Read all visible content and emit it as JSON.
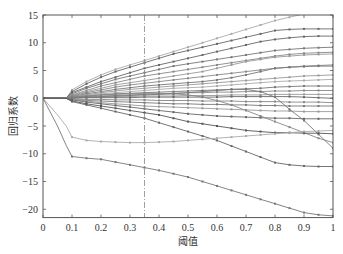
{
  "chart_data": {
    "type": "line",
    "title": "",
    "xlabel": "阈值",
    "ylabel": "回归系数",
    "xlim": [
      0,
      1
    ],
    "ylim": [
      -21.5,
      15
    ],
    "xticks": [
      0,
      0.1,
      0.2,
      0.3,
      0.4,
      0.5,
      0.6,
      0.7,
      0.8,
      0.9,
      1
    ],
    "xtick_labels": [
      "0",
      "0.1",
      "0.2",
      "0.3",
      "0.4",
      "0.5",
      "0.6",
      "0.7",
      "0.8",
      "0.9",
      "1"
    ],
    "yticks": [
      15,
      10,
      5,
      0,
      -5,
      -10,
      -15,
      -20
    ],
    "ytick_labels": [
      "15",
      "10",
      "5",
      "0",
      "−5",
      "−10",
      "−15",
      "−20"
    ],
    "grid": false,
    "legend": null,
    "vline": {
      "x": 0.35,
      "style": "dash-dot",
      "color": "#888888"
    },
    "x": [
      0,
      0.05,
      0.08,
      0.1,
      0.15,
      0.2,
      0.25,
      0.3,
      0.35,
      0.4,
      0.45,
      0.5,
      0.55,
      0.6,
      0.65,
      0.7,
      0.75,
      0.8,
      0.85,
      0.9,
      0.95,
      1
    ],
    "series": [
      {
        "name": "s1",
        "color": "#aaaaaa",
        "values": [
          0,
          0,
          0,
          1.5,
          3.0,
          4.2,
          5.2,
          6.0,
          6.8,
          7.6,
          8.4,
          9.2,
          10.0,
          10.8,
          11.6,
          12.4,
          13.2,
          14.0,
          14.6,
          15.2,
          15.6,
          16.0
        ]
      },
      {
        "name": "s2",
        "color": "#666666",
        "values": [
          0,
          0,
          0,
          1.2,
          2.6,
          3.8,
          4.8,
          5.6,
          6.4,
          7.2,
          8.0,
          8.6,
          9.2,
          9.8,
          10.4,
          11.0,
          11.6,
          12.2,
          12.4,
          12.5,
          12.5,
          12.5
        ]
      },
      {
        "name": "s3",
        "color": "#666666",
        "values": [
          0,
          0,
          0,
          1.0,
          2.0,
          3.0,
          3.8,
          4.6,
          5.4,
          6.0,
          6.6,
          7.2,
          7.8,
          8.4,
          9.0,
          9.6,
          10.2,
          10.6,
          10.9,
          11.1,
          11.2,
          11.2
        ]
      },
      {
        "name": "s4",
        "color": "#777777",
        "values": [
          0,
          0,
          0,
          0.8,
          1.8,
          2.6,
          3.4,
          4.0,
          4.6,
          5.2,
          5.8,
          6.2,
          6.6,
          7.0,
          7.4,
          7.8,
          8.2,
          8.6,
          8.8,
          9.0,
          9.1,
          9.2
        ]
      },
      {
        "name": "s5",
        "color": "#888888",
        "values": [
          0,
          0,
          0,
          0.6,
          1.4,
          2.2,
          2.8,
          3.4,
          4.0,
          4.4,
          4.8,
          5.2,
          5.6,
          6.0,
          6.4,
          6.8,
          7.2,
          7.6,
          7.9,
          8.1,
          8.2,
          8.3
        ]
      },
      {
        "name": "s6",
        "color": "#999999",
        "values": [
          0,
          0,
          0,
          0.5,
          1.2,
          1.8,
          2.4,
          2.8,
          3.2,
          3.6,
          4.0,
          4.4,
          4.8,
          5.4,
          6.0,
          6.6,
          7.0,
          7.4,
          7.6,
          7.8,
          7.9,
          8.0
        ]
      },
      {
        "name": "s7",
        "color": "#888888",
        "values": [
          0,
          0,
          0,
          0.4,
          1.0,
          1.5,
          2.0,
          2.4,
          2.7,
          3.0,
          3.3,
          3.6,
          3.9,
          4.2,
          4.5,
          4.8,
          5.1,
          5.4,
          5.6,
          5.8,
          5.9,
          6.0
        ]
      },
      {
        "name": "s8",
        "color": "#777777",
        "values": [
          0,
          0,
          0,
          0.3,
          0.8,
          1.2,
          1.6,
          1.9,
          2.2,
          2.4,
          2.6,
          2.8,
          3.0,
          3.3,
          3.7,
          4.2,
          4.8,
          5.4,
          5.6,
          5.7,
          5.8,
          5.8
        ]
      },
      {
        "name": "s9",
        "color": "#999999",
        "values": [
          0,
          0,
          0,
          0.3,
          0.6,
          1.0,
          1.3,
          1.6,
          1.8,
          2.0,
          2.2,
          2.4,
          2.6,
          2.8,
          3.0,
          3.2,
          3.4,
          3.6,
          3.8,
          4.0,
          4.1,
          4.2
        ]
      },
      {
        "name": "s10",
        "color": "#aaaaaa",
        "values": [
          0,
          0,
          0,
          0.2,
          0.5,
          0.8,
          1.0,
          1.2,
          1.4,
          1.6,
          1.8,
          1.9,
          2.0,
          2.2,
          2.4,
          2.6,
          2.8,
          3.0,
          3.1,
          3.2,
          3.3,
          3.4
        ]
      },
      {
        "name": "s11",
        "color": "#777777",
        "values": [
          0,
          0,
          0,
          0.2,
          0.4,
          0.6,
          0.8,
          0.9,
          1.0,
          1.1,
          1.2,
          1.3,
          1.4,
          1.5,
          1.6,
          1.7,
          1.8,
          2.0,
          2.1,
          2.2,
          2.2,
          2.2
        ]
      },
      {
        "name": "s12",
        "color": "#888888",
        "values": [
          0,
          0,
          0,
          0.1,
          0.3,
          0.4,
          0.5,
          0.6,
          0.7,
          0.8,
          0.9,
          1.0,
          1.0,
          1.1,
          1.1,
          1.2,
          1.2,
          1.3,
          1.3,
          1.4,
          1.4,
          1.4
        ]
      },
      {
        "name": "s13",
        "color": "#999999",
        "values": [
          0,
          0,
          0,
          0.1,
          0.2,
          0.2,
          0.3,
          0.3,
          0.4,
          0.4,
          0.4,
          0.5,
          0.5,
          0.5,
          0.6,
          0.6,
          0.6,
          0.7,
          0.7,
          0.7,
          0.7,
          0.7
        ]
      },
      {
        "name": "s14",
        "color": "#666666",
        "values": [
          0,
          0,
          0,
          0,
          0.1,
          0.1,
          0.1,
          0.1,
          0.2,
          0.2,
          0.2,
          0.2,
          0.2,
          0.2,
          0.3,
          0.3,
          0.3,
          0.3,
          0.3,
          0.2,
          0.1,
          0.0
        ]
      },
      {
        "name": "s15",
        "color": "#888888",
        "values": [
          0,
          0,
          0,
          -0.1,
          -0.2,
          -0.2,
          -0.3,
          -0.3,
          -0.3,
          -0.4,
          -0.4,
          -0.4,
          -0.5,
          -0.5,
          -0.5,
          -0.6,
          -0.6,
          -0.6,
          -0.7,
          -0.7,
          -0.7,
          -0.8
        ]
      },
      {
        "name": "s16",
        "color": "#777777",
        "values": [
          0,
          0,
          0,
          -0.2,
          -0.4,
          -0.5,
          -0.6,
          -0.7,
          -0.8,
          -0.9,
          -1.0,
          -1.0,
          -1.1,
          -1.1,
          -1.2,
          -1.2,
          -1.3,
          -1.3,
          -1.4,
          -1.4,
          -1.4,
          -1.4
        ]
      },
      {
        "name": "s17",
        "color": "#999999",
        "values": [
          0,
          0,
          0,
          -0.2,
          -0.5,
          -0.8,
          -1.0,
          -1.2,
          -1.4,
          -1.5,
          -1.6,
          -1.7,
          -1.8,
          -1.9,
          -2.0,
          -2.1,
          -2.2,
          -2.3,
          -2.3,
          -2.4,
          -2.4,
          -2.4
        ]
      },
      {
        "name": "s18",
        "color": "#666666",
        "values": [
          0,
          0,
          0,
          -0.3,
          -0.7,
          -1.0,
          -1.3,
          -1.6,
          -1.9,
          -2.2,
          -2.5,
          -2.8,
          -3.0,
          -3.2,
          -3.3,
          -3.4,
          -3.5,
          -3.6,
          -3.6,
          -3.7,
          -3.7,
          -3.7
        ]
      },
      {
        "name": "s19",
        "color": "#888888",
        "values": [
          0,
          0,
          0,
          0.2,
          0.4,
          0.6,
          0.7,
          0.8,
          0.9,
          0.9,
          0.8,
          0.6,
          0.2,
          -0.4,
          -1.2,
          -2.2,
          -3.2,
          -4.2,
          -5.2,
          -6.2,
          -7.2,
          -8.0
        ]
      },
      {
        "name": "s20",
        "color": "#777777",
        "values": [
          0,
          0,
          0,
          0.1,
          0.2,
          0.3,
          0.4,
          0.5,
          0.6,
          0.7,
          0.8,
          1.0,
          1.2,
          1.4,
          1.6,
          1.6,
          1.2,
          0.2,
          -2.0,
          -4.0,
          -6.5,
          -9.0
        ]
      },
      {
        "name": "s21",
        "color": "#555555",
        "values": [
          0,
          0,
          0,
          -0.5,
          -1.0,
          -1.4,
          -1.8,
          -2.2,
          -2.6,
          -3.0,
          -3.6,
          -4.2,
          -4.6,
          -5.0,
          -5.4,
          -5.8,
          -6.0,
          -6.2,
          -6.2,
          -6.3,
          -6.3,
          -6.4
        ]
      },
      {
        "name": "s22",
        "color": "#666666",
        "values": [
          0,
          0,
          0,
          -0.6,
          -1.2,
          -1.8,
          -2.4,
          -3.0,
          -3.6,
          -4.4,
          -5.2,
          -6.0,
          -6.8,
          -7.6,
          -8.6,
          -9.6,
          -10.6,
          -11.6,
          -12.0,
          -12.2,
          -12.3,
          -12.3
        ]
      },
      {
        "name": "s23",
        "color": "#aaaaaa",
        "values": [
          0,
          -3.0,
          -5.0,
          -7.0,
          -7.6,
          -7.8,
          -7.9,
          -8.0,
          -8.0,
          -7.9,
          -7.8,
          -7.6,
          -7.4,
          -7.2,
          -7.0,
          -6.8,
          -6.6,
          -6.4,
          -6.2,
          -6.0,
          -5.9,
          -5.8
        ]
      },
      {
        "name": "s24",
        "color": "#777777",
        "values": [
          0,
          -5.0,
          -8.5,
          -10.5,
          -10.8,
          -11.0,
          -11.5,
          -12.0,
          -12.5,
          -13.0,
          -13.6,
          -14.2,
          -15.0,
          -15.8,
          -16.6,
          -17.4,
          -18.2,
          -19.0,
          -19.8,
          -20.6,
          -21.0,
          -21.2
        ]
      }
    ]
  }
}
